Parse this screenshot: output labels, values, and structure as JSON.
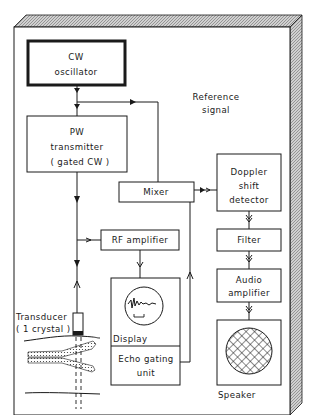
{
  "diagram": {
    "blocks": {
      "cw_oscillator": [
        "CW",
        "oscillator"
      ],
      "pw_transmitter": [
        "PW",
        "transmitter",
        "( gated CW )"
      ],
      "mixer": [
        "Mixer"
      ],
      "rf_amplifier": [
        "RF amplifier"
      ],
      "doppler_detector": [
        "Doppler",
        "shift",
        "detector"
      ],
      "filter": [
        "Filter"
      ],
      "audio_amplifier": [
        "Audio",
        "amplifier"
      ],
      "display": [
        "Display"
      ],
      "echo_gating": [
        "Echo gating",
        "unit"
      ],
      "speaker": [
        "Speaker"
      ]
    },
    "labels": {
      "reference_signal": [
        "Reference",
        "signal"
      ],
      "transducer": [
        "Transducer",
        "( 1 crystal )"
      ]
    },
    "colors": {
      "ink": "#1a1a1a",
      "hatch": "#9a9a9a",
      "background": "#ffffff"
    }
  }
}
